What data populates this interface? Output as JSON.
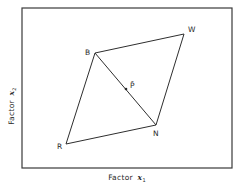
{
  "diagram": {
    "type": "factor-space-parallelogram",
    "frame": {
      "x1": 22,
      "y1": 8,
      "x2": 232,
      "y2": 168
    },
    "axes": {
      "x": {
        "label_prefix": "Factor",
        "var": "x",
        "sub": "1"
      },
      "y": {
        "label_prefix": "Factor",
        "var": "x",
        "sub": "2"
      }
    },
    "vertices": [
      {
        "id": "B",
        "label": "B",
        "x": 95,
        "y": 53,
        "lx": 85,
        "ly": 55
      },
      {
        "id": "W",
        "label": "W",
        "x": 184,
        "y": 34,
        "lx": 188,
        "ly": 32
      },
      {
        "id": "N",
        "label": "N",
        "x": 156,
        "y": 125,
        "lx": 153,
        "ly": 136
      },
      {
        "id": "R",
        "label": "R",
        "x": 66,
        "y": 144,
        "lx": 57,
        "ly": 149
      }
    ],
    "edges": [
      [
        "B",
        "W"
      ],
      [
        "W",
        "N"
      ],
      [
        "N",
        "R"
      ],
      [
        "R",
        "B"
      ],
      [
        "B",
        "N"
      ]
    ],
    "center_point": {
      "label": "P̄",
      "x": 126,
      "y": 89,
      "lx": 130,
      "ly": 88
    }
  }
}
